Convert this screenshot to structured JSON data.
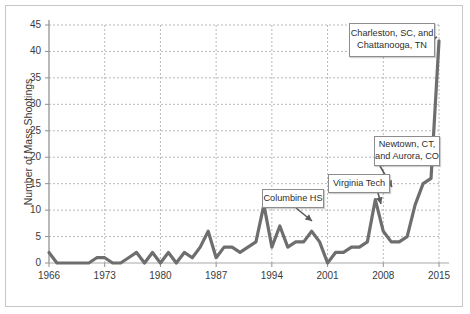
{
  "chart_data": {
    "type": "line",
    "title": "",
    "xlabel": "",
    "ylabel": "Number of Mass Shootings",
    "xlim": [
      1966,
      2015
    ],
    "ylim": [
      0,
      45
    ],
    "ytick_labels": [
      "0",
      "5",
      "10",
      "15",
      "20",
      "25",
      "30",
      "35",
      "40",
      "45"
    ],
    "ytick_values": [
      0,
      5,
      10,
      15,
      20,
      25,
      30,
      35,
      40,
      45
    ],
    "xtick_labels": [
      "1966",
      "1973",
      "1980",
      "1987",
      "1994",
      "2001",
      "2008",
      "2015"
    ],
    "xtick_values": [
      1966,
      1973,
      1980,
      1987,
      1994,
      2001,
      2008,
      2015
    ],
    "grid": true,
    "legend": "none",
    "line_color": "#6e6e6e",
    "series": [
      {
        "name": "Mass Shootings",
        "x": [
          1966,
          1967,
          1968,
          1969,
          1970,
          1971,
          1972,
          1973,
          1974,
          1975,
          1976,
          1977,
          1978,
          1979,
          1980,
          1981,
          1982,
          1983,
          1984,
          1985,
          1986,
          1987,
          1988,
          1989,
          1990,
          1991,
          1992,
          1993,
          1994,
          1995,
          1996,
          1997,
          1998,
          1999,
          2000,
          2001,
          2002,
          2003,
          2004,
          2005,
          2006,
          2007,
          2008,
          2009,
          2010,
          2011,
          2012,
          2013,
          2014,
          2015
        ],
        "values": [
          2,
          0,
          0,
          0,
          0,
          0,
          1,
          1,
          0,
          0,
          1,
          2,
          0,
          2,
          0,
          2,
          0,
          2,
          1,
          3,
          6,
          1,
          3,
          3,
          2,
          3,
          4,
          11,
          3,
          7,
          3,
          4,
          4,
          6,
          4,
          0,
          2,
          2,
          3,
          3,
          4,
          12,
          6,
          4,
          4,
          5,
          11,
          15,
          16,
          42
        ]
      }
    ],
    "annotations": [
      {
        "id": "charleston",
        "label_line1": "Charleston, SC, and",
        "label_line2": "Chattanooga, TN",
        "points_to_year": 2015,
        "points_to_value": 42
      },
      {
        "id": "newtown",
        "label_line1": "Newtown, CT,",
        "label_line2": "and Aurora, CO",
        "points_to_year": 2012,
        "points_to_value": 11
      },
      {
        "id": "virginia-tech",
        "label_line1": "Virginia Tech",
        "label_line2": "",
        "points_to_year": 2007,
        "points_to_value": 12
      },
      {
        "id": "columbine",
        "label_line1": "Columbine HS",
        "label_line2": "",
        "points_to_year": 1999,
        "points_to_value": 6
      }
    ]
  }
}
